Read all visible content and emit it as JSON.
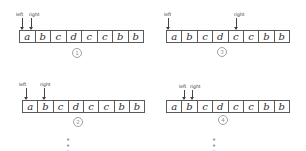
{
  "diagram": {
    "cells": [
      "a",
      "b",
      "c",
      "d",
      "c",
      "c",
      "b",
      "b"
    ],
    "labels": {
      "left": "left",
      "right": "right"
    },
    "panels": [
      {
        "id": 1,
        "step_label": "1",
        "left_index": 0,
        "right_index": 0,
        "ellipsis": ""
      },
      {
        "id": 3,
        "step_label": "3",
        "left_index": 0,
        "right_index": 4,
        "ellipsis": ""
      },
      {
        "id": 2,
        "step_label": "2",
        "left_index": 0,
        "right_index": 1,
        "ellipsis": "• • •"
      },
      {
        "id": 4,
        "step_label": "4",
        "left_index": 1,
        "right_index": 1,
        "ellipsis": "• • •"
      }
    ]
  }
}
